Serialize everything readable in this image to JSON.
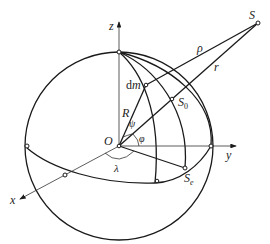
{
  "figure": {
    "type": "geometry-diagram"
  },
  "labels": {
    "z_axis": "z",
    "y_axis": "y",
    "x_axis": "x",
    "origin": "O",
    "point_S": "S",
    "rho": "ρ",
    "r": "r",
    "dm_d": "d",
    "dm_m": "m",
    "R": "R",
    "psi": "ψ",
    "phi": "φ",
    "lambda": "λ",
    "S0_main": "S",
    "S0_sub": "0",
    "Se_main": "S",
    "Se_sub": "e"
  },
  "colors": {
    "line": "#1a1a1a",
    "background": "#ffffff"
  }
}
